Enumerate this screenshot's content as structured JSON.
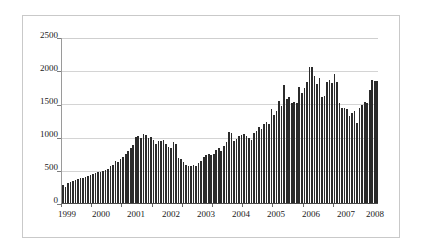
{
  "chart_data": {
    "type": "bar",
    "title": "",
    "subtitle": "",
    "xlabel": "",
    "ylabel": "",
    "ylim": [
      0,
      2500
    ],
    "yticks": [
      0,
      500,
      1000,
      1500,
      2000,
      2500
    ],
    "ytick_labels": [
      "0",
      "500",
      "1000",
      "1500",
      "2000",
      "2500"
    ],
    "xtick_labels": [
      "1999",
      "2000",
      "2001",
      "2002",
      "2003",
      "2004",
      "2005",
      "2006",
      "2007",
      "2008"
    ],
    "grid": true,
    "legend": null,
    "legend_position": "none",
    "bar_color": "#2b2b2b",
    "grid_color": "#d4d4d4",
    "axis_color": "#4a4a4a",
    "frame_color": "#c9c9c9",
    "series_name": "",
    "x_granularity": "monthly",
    "x_start": "1999-01",
    "x_end": "2008-12",
    "n_bars": 118,
    "values": [
      270,
      250,
      300,
      320,
      330,
      345,
      360,
      375,
      385,
      400,
      415,
      430,
      440,
      455,
      465,
      475,
      485,
      500,
      515,
      560,
      580,
      640,
      620,
      670,
      700,
      750,
      790,
      830,
      880,
      1005,
      1010,
      980,
      1040,
      1030,
      990,
      1005,
      950,
      900,
      945,
      940,
      950,
      900,
      850,
      830,
      920,
      900,
      680,
      660,
      620,
      575,
      560,
      560,
      570,
      555,
      600,
      640,
      700,
      720,
      745,
      720,
      740,
      800,
      830,
      790,
      865,
      920,
      1075,
      1060,
      940,
      975,
      1010,
      1030,
      1040,
      1020,
      985,
      950,
      1065,
      1090,
      1145,
      1120,
      1190,
      1230,
      1200,
      1430,
      1330,
      1390,
      1545,
      1470,
      1790,
      1580,
      1610,
      1520,
      1530,
      1515,
      1760,
      1660,
      1740,
      1830,
      2060,
      2055,
      1920,
      1810,
      1890,
      1600,
      1625,
      1835,
      1870,
      1815,
      1960,
      1830,
      1520,
      1440,
      1440,
      1420,
      1320,
      1360,
      1395,
      1215,
      1440,
      1490,
      1530,
      1510,
      1710,
      1860,
      1855,
      1845
    ]
  },
  "ylabels": {
    "t0": "0",
    "t1": "500",
    "t2": "1000",
    "t3": "1500",
    "t4": "2000",
    "t5": "2500"
  },
  "xlabels": {
    "y1999": "1999",
    "y2000": "2000",
    "y2001": "2001",
    "y2002": "2002",
    "y2003": "2003",
    "y2004": "2004",
    "y2005": "2005",
    "y2006": "2006",
    "y2007": "2007",
    "y2008": "2008"
  }
}
